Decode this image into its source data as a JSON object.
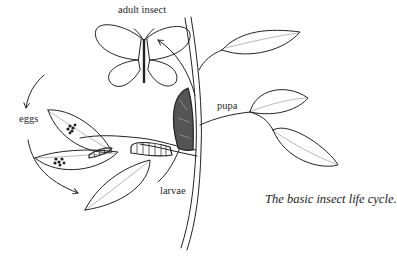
{
  "diagram": {
    "caption": "The basic insect life cycle.",
    "stages": [
      {
        "id": "adult",
        "label": "adult insect"
      },
      {
        "id": "eggs",
        "label": "eggs"
      },
      {
        "id": "larvae",
        "label": "larvae"
      },
      {
        "id": "pupa",
        "label": "pupa"
      }
    ],
    "cycle_order": [
      "adult insect",
      "eggs",
      "larvae",
      "pupa",
      "adult insect"
    ],
    "colors": {
      "ink": "#222222",
      "background": "#ffffff",
      "vein": "#888888"
    }
  }
}
